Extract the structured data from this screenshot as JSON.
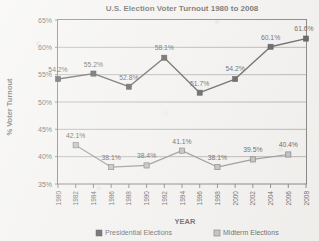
{
  "chart_data": {
    "type": "line",
    "title": "U.S. Election Voter Turnout 1980 to 2008",
    "xlabel": "YEAR",
    "ylabel": "% Voter Turnout",
    "ylim": [
      35,
      65
    ],
    "ytick_step": 5,
    "ytick_labels": [
      "35%",
      "40%",
      "45%",
      "50%",
      "55%",
      "60%",
      "65%"
    ],
    "xlim": [
      1980,
      2008
    ],
    "xtick_labels": [
      "1980",
      "1982",
      "1984",
      "1986",
      "1988",
      "1990",
      "1992",
      "1994",
      "1996",
      "1998",
      "2000",
      "2002",
      "2004",
      "2006",
      "2008"
    ],
    "grid": true,
    "legend_position": "bottom",
    "series": [
      {
        "name": "Presidential Elections",
        "color": "#141414",
        "marker": "filled-square",
        "x": [
          1980,
          1984,
          1988,
          1992,
          1996,
          2000,
          2004,
          2008
        ],
        "values": [
          54.2,
          55.2,
          52.8,
          58.1,
          51.7,
          54.2,
          60.1,
          61.6
        ],
        "labels": [
          "54.2%",
          "55.2%",
          "52.8%",
          "58.1%",
          "51.7%",
          "54.2%",
          "60.1%",
          "61.6%"
        ],
        "label_offsets": [
          {
            "dx": 0,
            "dy": -7
          },
          {
            "dx": 0,
            "dy": -7
          },
          {
            "dx": 0,
            "dy": -7
          },
          {
            "dx": 0,
            "dy": -8
          },
          {
            "dx": 0,
            "dy": -7
          },
          {
            "dx": 0,
            "dy": -8
          },
          {
            "dx": 0,
            "dy": -7
          },
          {
            "dx": -2,
            "dy": -8
          }
        ]
      },
      {
        "name": "Midterm Elections",
        "color": "#a8a8a8",
        "marker": "shaded-square",
        "x": [
          1982,
          1986,
          1990,
          1994,
          1998,
          2002,
          2006
        ],
        "values": [
          42.1,
          38.1,
          38.4,
          41.1,
          38.1,
          39.5,
          40.4
        ],
        "labels": [
          "42.1%",
          "38.1%",
          "38.4%",
          "41.1%",
          "38.1%",
          "39.5%",
          "40.4%"
        ],
        "label_offsets": [
          {
            "dx": 0,
            "dy": -7
          },
          {
            "dx": 0,
            "dy": -7
          },
          {
            "dx": 0,
            "dy": -7
          },
          {
            "dx": 0,
            "dy": -7
          },
          {
            "dx": 0,
            "dy": -7
          },
          {
            "dx": 0,
            "dy": -7
          },
          {
            "dx": 0,
            "dy": -7
          }
        ]
      }
    ]
  },
  "legend": {
    "items": [
      {
        "label": "Presidential Elections",
        "swatch": "#141414"
      },
      {
        "label": "Midterm Elections",
        "swatch": "#a8a8a8"
      }
    ]
  }
}
